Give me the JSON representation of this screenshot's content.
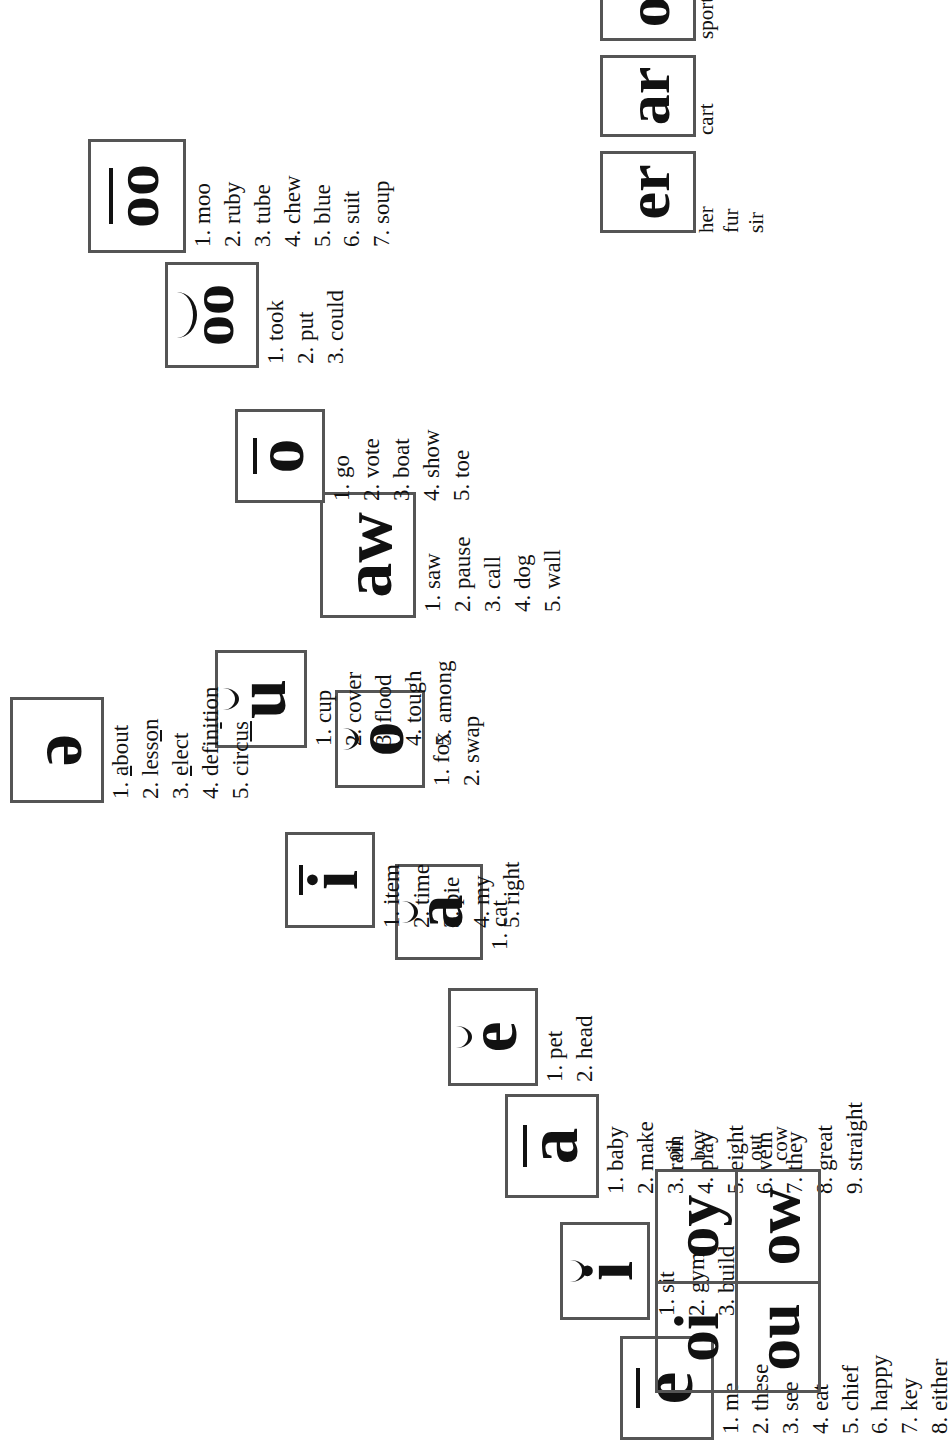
{
  "groups": [
    {
      "id": "long-e",
      "symbol": "e",
      "mark": "macron",
      "label": "long-e",
      "words": [
        "1. me",
        "2. these",
        "3. see",
        "4. eat",
        "5. chief",
        "6. happy",
        "7. key",
        "8. either"
      ]
    },
    {
      "id": "short-i",
      "symbol": "i",
      "mark": "breve",
      "label": "short-i",
      "words": [
        "1. sit",
        "2. gym",
        "3. build"
      ]
    },
    {
      "id": "long-a",
      "symbol": "a",
      "mark": "macron",
      "label": "long-a",
      "words": [
        "1. baby",
        "2. make",
        "3. rain",
        "4. play",
        "5. eight",
        "6. vein",
        "7. they",
        "8. great",
        "9. straight"
      ]
    },
    {
      "id": "short-e",
      "symbol": "e",
      "mark": "breve",
      "label": "short-e",
      "words": [
        "1. pet",
        "2. head"
      ]
    },
    {
      "id": "short-a",
      "symbol": "a",
      "mark": "breve",
      "label": "short-a",
      "words": [
        "1. cat"
      ]
    },
    {
      "id": "long-i",
      "symbol": "i",
      "mark": "macron",
      "label": "long-i",
      "words": [
        "1. item",
        "2. time",
        "3. pie",
        "4. my",
        "5. right"
      ]
    },
    {
      "id": "short-o",
      "symbol": "o",
      "mark": "breve",
      "label": "short-o",
      "words": [
        "1. fox",
        "2. swap"
      ]
    },
    {
      "id": "short-u",
      "symbol": "u",
      "mark": "breve",
      "label": "short-u",
      "words": [
        "1. cup",
        "2. cover",
        "3. flood",
        "4. tough",
        "5. among"
      ]
    },
    {
      "id": "aw",
      "symbol": "aw",
      "mark": "none",
      "label": "aw",
      "words": [
        "1. saw",
        "2. pause",
        "3. call",
        "4. dog",
        "5. wall"
      ]
    },
    {
      "id": "long-o",
      "symbol": "o",
      "mark": "macron",
      "label": "long-o",
      "words": [
        "1. go",
        "2. vote",
        "3. boat",
        "4. show",
        "5. toe"
      ]
    },
    {
      "id": "short-oo",
      "symbol": "oo",
      "mark": "breve",
      "label": "short-oo",
      "words": [
        "1. took",
        "2. put",
        "3. could"
      ]
    },
    {
      "id": "long-oo",
      "symbol": "oo",
      "mark": "macron",
      "label": "long-oo",
      "words": [
        "1. moo",
        "2. ruby",
        "3. tube",
        "4. chew",
        "5. blue",
        "6. suit",
        "7. soup"
      ]
    },
    {
      "id": "schwa",
      "symbol": "ə",
      "mark": "none",
      "label": "schwa",
      "words_html": [
        "1. <u>a</u>bout",
        "2. less<u>o</u>n",
        "3. <u>e</u>lect",
        "4. defin<u>i</u>tion",
        "5. circ<u>us</u>"
      ],
      "words": [
        "1. about",
        "2. lesson",
        "3. elect",
        "4. definition",
        "5. circus"
      ]
    }
  ],
  "r_controlled": {
    "label": "r-controlled vowels",
    "items": [
      {
        "symbol": "er",
        "words": [
          "her",
          "fur",
          "sir"
        ]
      },
      {
        "symbol": "ar",
        "words": [
          "cart"
        ]
      },
      {
        "symbol": "or",
        "words": [
          "sport"
        ]
      }
    ]
  },
  "diphthongs": {
    "label": "diphthongs",
    "cells": [
      "oi",
      "oy",
      "ou",
      "ow"
    ],
    "pairs": [
      {
        "symbols": [
          "oi",
          "oy"
        ],
        "words": [
          "oil",
          "boy"
        ]
      },
      {
        "symbols": [
          "ou",
          "ow"
        ],
        "words": [
          "out",
          "cow"
        ]
      }
    ]
  }
}
